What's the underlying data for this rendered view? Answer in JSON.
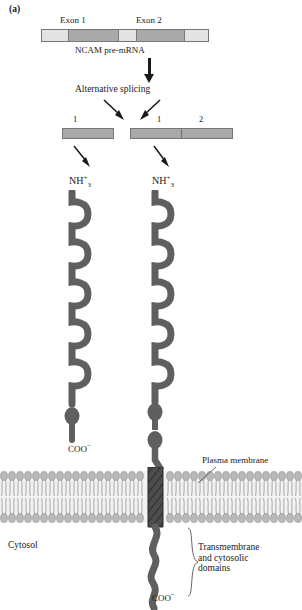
{
  "figure": {
    "panel_label": "(a)",
    "title_text": "NCAM pre-mRNA alternative splicing"
  },
  "premrna": {
    "exon1_label": "Exon 1",
    "exon2_label": "Exon 2",
    "caption": "NCAM pre-mRNA",
    "segments": [
      {
        "kind": "intron",
        "width_pct": 16
      },
      {
        "kind": "exon",
        "width_pct": 30
      },
      {
        "kind": "intron",
        "width_pct": 11
      },
      {
        "kind": "exon",
        "width_pct": 29
      },
      {
        "kind": "intron",
        "width_pct": 14
      }
    ]
  },
  "process": {
    "alternative_splicing_label": "Alternative splicing"
  },
  "mrna_left": {
    "segment_labels": [
      "1"
    ],
    "segments": [
      {
        "label": "1",
        "width_pct": 100
      }
    ]
  },
  "mrna_right": {
    "segment_labels": [
      "1",
      "2"
    ],
    "segments": [
      {
        "label": "1",
        "width_pct": 50
      },
      {
        "label": "2",
        "width_pct": 50
      }
    ]
  },
  "protein_left": {
    "n_terminus": "NH",
    "n_terminus_charge": "+",
    "n_terminus_sub": "3",
    "c_terminus": "COO",
    "c_terminus_charge": "−",
    "ig_domain_count": 5,
    "bead_count": 1
  },
  "protein_right": {
    "n_terminus": "NH",
    "n_terminus_charge": "+",
    "n_terminus_sub": "3",
    "c_terminus": "COO",
    "c_terminus_charge": "−",
    "ig_domain_count": 5,
    "bead_count": 2
  },
  "membrane": {
    "label": "Plasma membrane",
    "cytosol_label": "Cytosol",
    "domain_label_line1": "Transmembrane",
    "domain_label_line2": "and cytosolic",
    "domain_label_line3": "domains"
  },
  "colors": {
    "exon_fill": "#a9a9a9",
    "intron_fill": "#e3e3e3",
    "protein_stroke": "#555555",
    "protein_fill": "#5f5f5f",
    "membrane_head": "#b9b9b9",
    "membrane_tail": "#d9d9d9",
    "text": "#1a1a1a",
    "arrow": "#1a1a1a"
  }
}
